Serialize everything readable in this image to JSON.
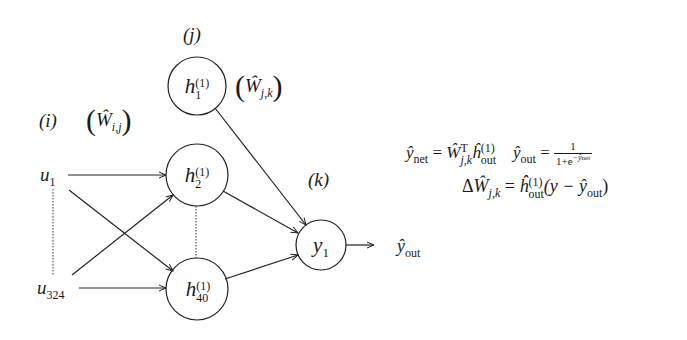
{
  "diagram": {
    "type": "neural-network",
    "layer_labels": {
      "input": "(i)",
      "hidden": "(j)",
      "output": "(k)"
    },
    "weight_labels": {
      "input_hidden": "Ŵ_{i,j}",
      "hidden_output": "Ŵ_{j,k}"
    },
    "nodes": {
      "inputs": [
        {
          "id": "u1",
          "base": "u",
          "sub": "1"
        },
        {
          "id": "u324",
          "base": "u",
          "sub": "324"
        }
      ],
      "hidden": [
        {
          "id": "h1",
          "base": "h",
          "sub": "1",
          "sup": "(1)"
        },
        {
          "id": "h2",
          "base": "h",
          "sub": "2",
          "sup": "(1)"
        },
        {
          "id": "h40",
          "base": "h",
          "sub": "40",
          "sup": "(1)"
        }
      ],
      "outputs": [
        {
          "id": "y1",
          "base": "y",
          "sub": "1"
        }
      ]
    },
    "output_label": {
      "base": "ŷ",
      "sub": "out"
    },
    "edges": [
      [
        "u1",
        "h2"
      ],
      [
        "u1",
        "h40"
      ],
      [
        "u324",
        "h2"
      ],
      [
        "u324",
        "h40"
      ],
      [
        "h1",
        "y1"
      ],
      [
        "h2",
        "y1"
      ],
      [
        "h40",
        "y1"
      ],
      [
        "y1",
        "output"
      ]
    ],
    "ellipsis_links": [
      [
        "u1",
        "u324"
      ],
      [
        "h2",
        "h40"
      ]
    ]
  },
  "equations": {
    "y_net": {
      "lhs": "ŷ",
      "lhs_sub": "net",
      "eq": "=",
      "w": "Ŵ",
      "w_sub": "j,k",
      "w_sup": "T",
      "h": "ĥ",
      "h_sub": "out",
      "h_sup": "(1)"
    },
    "y_out": {
      "lhs": "ŷ",
      "lhs_sub": "out",
      "eq": "=",
      "num": "1",
      "den": "1+e",
      "den_sup": "−ŷ",
      "den_sup_sub": "net"
    },
    "delta_w": {
      "delta": "Δ",
      "w": "Ŵ",
      "w_sub": "j,k",
      "eq": "=",
      "h": "ĥ",
      "h_sub": "out",
      "h_sup": "(1)",
      "rhs": "(y − ŷ",
      "rhs_sub": "out",
      "rhs_close": ")"
    }
  }
}
